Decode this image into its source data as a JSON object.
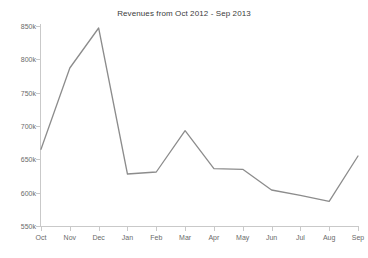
{
  "chart_data": {
    "type": "line",
    "title": "Revenues from Oct 2012 - Sep 2013",
    "xlabel": "",
    "ylabel": "",
    "categories": [
      "Oct",
      "Nov",
      "Dec",
      "Jan",
      "Feb",
      "Mar",
      "Apr",
      "May",
      "Jun",
      "Jul",
      "Aug",
      "Sep"
    ],
    "values": [
      665000,
      787000,
      847000,
      628000,
      631000,
      693000,
      636000,
      635000,
      604000,
      596000,
      587000,
      655000
    ],
    "series": [
      {
        "name": "Revenues",
        "values": [
          665000,
          787000,
          847000,
          628000,
          631000,
          693000,
          636000,
          635000,
          604000,
          596000,
          587000,
          655000
        ]
      }
    ],
    "ylim": [
      550000,
      850000
    ],
    "ytick_values": [
      550000,
      600000,
      650000,
      700000,
      750000,
      800000,
      850000
    ],
    "ytick_labels": [
      "550k",
      "600k",
      "650k",
      "700k",
      "750k",
      "800k",
      "850k"
    ],
    "grid": false,
    "legend": false,
    "legend_position": "none",
    "line_color": "#8c8c8c",
    "axis_color": "#c9c9c9",
    "text_color": "#6a6a6a",
    "title_color": "#3b3b3b",
    "background_color": "#ffffff"
  }
}
